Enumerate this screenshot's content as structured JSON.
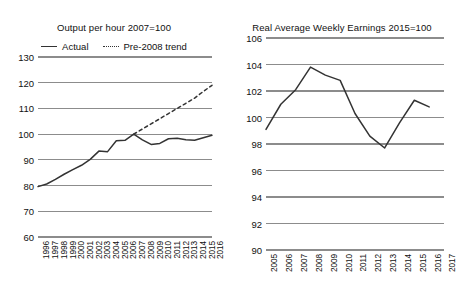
{
  "page": {
    "background": "#ffffff",
    "grid_color": "#8c8c8c",
    "line_color": "#333333"
  },
  "chart_data": [
    {
      "id": "output-per-hour",
      "type": "line",
      "title": "Output per hour 2007=100",
      "xlabel": "",
      "ylabel": "",
      "ylim": [
        60,
        130
      ],
      "yticks": [
        60,
        70,
        80,
        90,
        100,
        110,
        120,
        130
      ],
      "xlim": [
        1996,
        2016
      ],
      "grid": true,
      "legend_position": "top",
      "legend": [
        "Actual",
        "Pre-2008 trend"
      ],
      "categories": [
        1996,
        1997,
        1998,
        1999,
        2000,
        2001,
        2002,
        2003,
        2004,
        2005,
        2006,
        2007,
        2008,
        2009,
        2010,
        2011,
        2012,
        2013,
        2014,
        2015,
        2016
      ],
      "xticklabels": [
        "1996",
        "1997",
        "1998",
        "1999",
        "2000",
        "2001",
        "2002",
        "2003",
        "2004",
        "2005",
        "2006",
        "2007",
        "2008",
        "2009",
        "2010",
        "2011",
        "2012",
        "2013",
        "2014",
        "2015",
        "2016"
      ],
      "series": [
        {
          "name": "Actual",
          "style": "solid",
          "values": [
            79.6,
            80.6,
            82.4,
            84.4,
            86.2,
            87.9,
            90.2,
            93.4,
            93.2,
            97.4,
            97.6,
            100.0,
            97.8,
            96.0,
            96.4,
            98.2,
            98.4,
            97.8,
            97.6,
            98.6,
            99.6
          ]
        },
        {
          "name": "Pre-2008 trend",
          "style": "dashed",
          "values": [
            null,
            null,
            null,
            null,
            null,
            null,
            null,
            null,
            null,
            null,
            null,
            100.0,
            102.0,
            104.0,
            106.0,
            108.0,
            110.0,
            112.0,
            114.0,
            116.6,
            119.0
          ]
        }
      ]
    },
    {
      "id": "real-average-weekly-earnings",
      "type": "line",
      "title": "Real Average Weekly Earnings 2015=100",
      "xlabel": "",
      "ylabel": "",
      "ylim": [
        90,
        106
      ],
      "yticks": [
        90,
        92,
        94,
        96,
        98,
        100,
        102,
        104,
        106
      ],
      "xlim": [
        2005,
        2017
      ],
      "grid": true,
      "legend_position": "none",
      "categories": [
        2005,
        2006,
        2007,
        2008,
        2009,
        2010,
        2011,
        2012,
        2013,
        2014,
        2015,
        2016,
        2017
      ],
      "xticklabels": [
        "2005",
        "2006",
        "2007",
        "2008",
        "2009",
        "2010",
        "2011",
        "2012",
        "2013",
        "2014",
        "2015",
        "2016",
        "2017"
      ],
      "series": [
        {
          "name": "Real Average Weekly Earnings",
          "style": "solid",
          "values": [
            99.1,
            101.0,
            102.1,
            103.8,
            103.2,
            102.8,
            100.3,
            98.6,
            97.7,
            99.6,
            101.3,
            100.8,
            null
          ]
        }
      ]
    }
  ]
}
